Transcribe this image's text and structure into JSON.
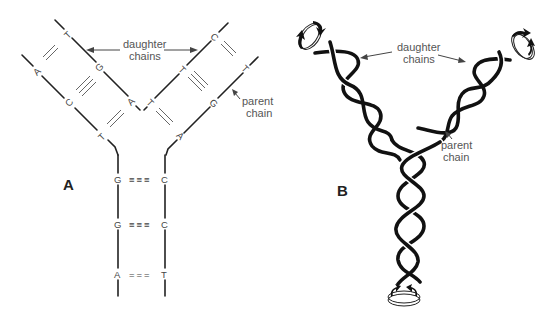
{
  "panels": {
    "a": {
      "label": "A",
      "daughter_label_line1": "daughter",
      "daughter_label_line2": "chains",
      "parent_label_line1": "parent",
      "parent_label_line2": "chain",
      "left_fork": {
        "outer_strand_bases": [
          "A",
          "C",
          "T"
        ],
        "inner_strand_bases": [
          "T",
          "G",
          "A"
        ]
      },
      "right_fork": {
        "inner_strand_bases": [
          "T",
          "C",
          "A"
        ],
        "outer_strand_bases": [
          "A",
          "G",
          "T"
        ]
      },
      "stem_pairs": [
        {
          "left": "G",
          "bond": "≡≡≡",
          "right": "C"
        },
        {
          "left": "G",
          "bond": "≡≡≡",
          "right": "C"
        },
        {
          "left": "A",
          "bond": "===",
          "right": "T"
        }
      ]
    },
    "b": {
      "label": "B",
      "daughter_label_line1": "daughter",
      "daughter_label_line2": "chains",
      "parent_label_line1": "parent",
      "parent_label_line2": "chain",
      "rotation_icons": [
        "rotation-top-left",
        "rotation-top-right",
        "rotation-bottom"
      ]
    }
  },
  "colors": {
    "ink": "#222222",
    "label": "#555555",
    "background": "#ffffff"
  }
}
